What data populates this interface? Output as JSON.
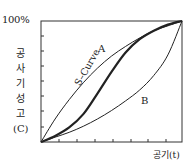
{
  "chart_data": {
    "type": "line",
    "title": "",
    "xlabel": "공기(t)",
    "ylabel": "공사기성고(C)",
    "ylabel_chars": [
      "공",
      "사",
      "기",
      "성",
      "고",
      "(C)"
    ],
    "y_top_tick_label": "100%",
    "xlim": [
      0,
      100
    ],
    "ylim": [
      0,
      100
    ],
    "grid": false,
    "x_minor_ticks": 7,
    "y_minor_ticks": 7,
    "series": [
      {
        "name": "A",
        "label": "A",
        "x": [
          0,
          10,
          20,
          30,
          40,
          50,
          60,
          70,
          80,
          90,
          100
        ],
        "values": [
          0,
          19,
          35,
          49,
          61,
          71,
          79,
          86,
          92,
          96,
          100
        ]
      },
      {
        "name": "S-Curve",
        "label": "S–Curve",
        "x": [
          0,
          10,
          20,
          30,
          40,
          50,
          60,
          70,
          80,
          90,
          100
        ],
        "values": [
          0,
          5,
          12,
          23,
          40,
          58,
          74,
          85,
          92,
          97,
          100
        ]
      },
      {
        "name": "B",
        "label": "B",
        "x": [
          0,
          10,
          20,
          30,
          40,
          50,
          60,
          70,
          80,
          90,
          100
        ],
        "values": [
          0,
          4,
          8,
          13,
          19,
          26,
          34,
          43,
          55,
          72,
          100
        ]
      }
    ]
  }
}
